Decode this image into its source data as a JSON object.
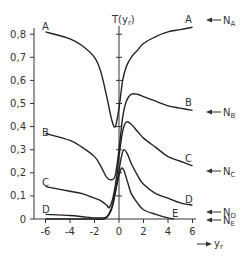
{
  "chart_data": {
    "type": "line",
    "title": "",
    "xlabel": "y_r",
    "ylabel": "T(y_r)",
    "xlim": [
      -6,
      6
    ],
    "ylim": [
      0,
      0.85
    ],
    "grid": false,
    "x_ticks": [
      "-6",
      "-4",
      "-2",
      "0",
      "2",
      "4",
      "6"
    ],
    "y_ticks": [
      "0",
      "0,1",
      "0,2",
      "0,3",
      "0,4",
      "0,5",
      "0,6",
      "0,7",
      "0,8"
    ],
    "series": [
      {
        "name": "A",
        "x": [
          -6,
          -4,
          -3,
          -2,
          -1.5,
          -1,
          -0.6,
          -0.3,
          0,
          0.3,
          0.6,
          1,
          1.5,
          2,
          3,
          4,
          5,
          6
        ],
        "y": [
          0.81,
          0.78,
          0.75,
          0.7,
          0.64,
          0.53,
          0.43,
          0.4,
          0.48,
          0.6,
          0.66,
          0.7,
          0.73,
          0.76,
          0.79,
          0.81,
          0.82,
          0.83
        ],
        "asymptote_label": "N_A",
        "asymptote": 0.83
      },
      {
        "name": "B",
        "x": [
          -6,
          -4,
          -3,
          -2,
          -1.5,
          -1,
          -0.6,
          -0.3,
          0,
          0.3,
          0.6,
          1,
          1.5,
          2,
          3,
          4,
          5,
          6
        ],
        "y": [
          0.37,
          0.34,
          0.31,
          0.27,
          0.23,
          0.18,
          0.17,
          0.19,
          0.3,
          0.44,
          0.51,
          0.54,
          0.54,
          0.53,
          0.51,
          0.49,
          0.48,
          0.47
        ],
        "asymptote_label": "N_B",
        "asymptote": 0.46
      },
      {
        "name": "C",
        "x": [
          -6,
          -4,
          -3,
          -2,
          -1.5,
          -1,
          -0.8,
          -0.5,
          -0.2,
          0,
          0.3,
          0.6,
          1,
          1.5,
          2,
          3,
          4,
          5,
          6
        ],
        "y": [
          0.14,
          0.12,
          0.11,
          0.09,
          0.08,
          0.06,
          0.05,
          0.09,
          0.18,
          0.27,
          0.38,
          0.42,
          0.41,
          0.38,
          0.35,
          0.31,
          0.27,
          0.25,
          0.23
        ],
        "asymptote_label": "N_C",
        "asymptote": 0.21
      },
      {
        "name": "D",
        "x": [
          -6,
          -4,
          -3,
          -2,
          -1.5,
          -1,
          -0.6,
          -0.3,
          0,
          0.2,
          0.4,
          0.7,
          1,
          1.5,
          2,
          3,
          4,
          5,
          6
        ],
        "y": [
          0.02,
          0.015,
          0.01,
          0.005,
          0.005,
          0.01,
          0.05,
          0.12,
          0.21,
          0.27,
          0.3,
          0.28,
          0.24,
          0.19,
          0.15,
          0.11,
          0.09,
          0.07,
          0.06
        ],
        "asymptote_label": "N_D",
        "asymptote": 0.03
      },
      {
        "name": "E",
        "x": [
          -6,
          -3,
          -2,
          -1.2,
          -0.8,
          -0.5,
          -0.2,
          0,
          0.2,
          0.4,
          0.7,
          1,
          1.5,
          2,
          3,
          4,
          4.5
        ],
        "y": [
          0.0,
          0.0,
          0.0,
          0.0,
          0.02,
          0.06,
          0.14,
          0.19,
          0.22,
          0.21,
          0.16,
          0.11,
          0.07,
          0.04,
          0.02,
          0.005,
          0.0
        ],
        "asymptote_label": "N_E",
        "asymptote": 0.0
      }
    ],
    "annotations": [
      "A",
      "B",
      "C",
      "D",
      "E",
      "N_A",
      "N_B",
      "N_C",
      "N_D",
      "N_E"
    ]
  },
  "axes": {
    "y_title_main": "T",
    "y_title_arg": "(y",
    "y_title_sub": "r",
    "y_title_close": ")",
    "x_title_main": "y",
    "x_title_sub": "r"
  },
  "curve_labels": {
    "left": {
      "A": "A",
      "B": "B",
      "C": "C",
      "D": "D"
    },
    "right": {
      "A": "A",
      "B": "B",
      "C": "C",
      "D": "D",
      "E": "E"
    }
  },
  "asymptote_labels": {
    "A": {
      "main": "N",
      "sub": "A"
    },
    "B": {
      "main": "N",
      "sub": "B"
    },
    "C": {
      "main": "N",
      "sub": "C"
    },
    "D": {
      "main": "N",
      "sub": "D"
    },
    "E": {
      "main": "N",
      "sub": "E"
    }
  }
}
